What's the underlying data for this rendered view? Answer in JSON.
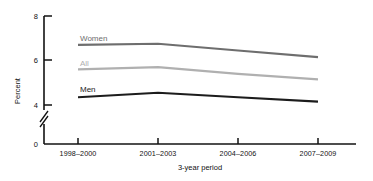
{
  "chart_data": {
    "type": "line",
    "title": "",
    "xlabel": "3-year period",
    "ylabel": "Percent",
    "categories": [
      "1998–2000",
      "2001–2003",
      "2004–2006",
      "2007–2009"
    ],
    "yticks": [
      "0",
      "4",
      "6",
      "8"
    ],
    "ylim": [
      0,
      8
    ],
    "axis_break": true,
    "axis_break_between": [
      0,
      4
    ],
    "grid": false,
    "legend_position": "inline-left-of-series",
    "series": [
      {
        "name": "Women",
        "label": "Women",
        "color": "#6e6e6e",
        "values": [
          6.7,
          6.75,
          6.45,
          6.15
        ]
      },
      {
        "name": "All",
        "label": "All",
        "color": "#b0b0b0",
        "values": [
          5.6,
          5.7,
          5.4,
          5.15
        ]
      },
      {
        "name": "Men",
        "label": "Men",
        "color": "#1c1c1c",
        "values": [
          4.35,
          4.55,
          4.35,
          4.15
        ]
      }
    ]
  },
  "axis": {
    "y_title": "Percent",
    "x_title": "3-year period",
    "y_tick_0": "0",
    "y_tick_4": "4",
    "y_tick_6": "6",
    "y_tick_8": "8",
    "x_tick_1": "1998–2000",
    "x_tick_2": "2001–2003",
    "x_tick_3": "2004–2006",
    "x_tick_4": "2007–2009"
  },
  "series_labels": {
    "women": "Women",
    "all": "All",
    "men": "Men"
  },
  "colors": {
    "women": "#6e6e6e",
    "all": "#b0b0b0",
    "men": "#1c1c1c",
    "axis": "#121212",
    "background": "#ffffff"
  }
}
